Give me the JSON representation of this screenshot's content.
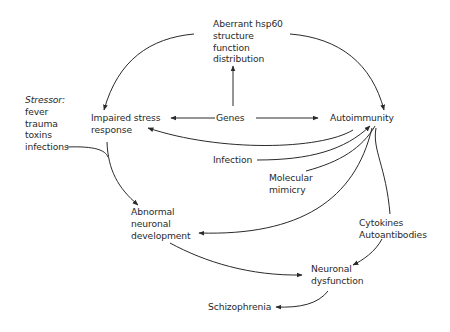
{
  "diagram": {
    "nodes": {
      "hsp60": {
        "lines": [
          "Aberrant hsp60",
          "structure",
          "function",
          "distribution"
        ]
      },
      "stressor": {
        "heading": "Stressor:",
        "lines": [
          "fever",
          "trauma",
          "toxins",
          "infections"
        ]
      },
      "impaired": {
        "lines": [
          "Impaired stress",
          "response"
        ]
      },
      "genes": {
        "lines": [
          "Genes"
        ]
      },
      "autoimmunity": {
        "lines": [
          "Autoimmunity"
        ]
      },
      "infection": {
        "lines": [
          "Infection"
        ]
      },
      "mimicry": {
        "lines": [
          "Molecular",
          "mimicry"
        ]
      },
      "abnormal": {
        "lines": [
          "Abnormal",
          "neuronal",
          "development"
        ]
      },
      "cytokines": {
        "lines": [
          "Cytokines",
          "Autoantibodies"
        ]
      },
      "dysfunction": {
        "lines": [
          "Neuronal",
          "dysfunction"
        ]
      },
      "schizophrenia": {
        "lines": [
          "Schizophrenia"
        ]
      }
    },
    "edges": [
      {
        "from": "hsp60",
        "to": "impaired"
      },
      {
        "from": "hsp60",
        "to": "autoimmunity"
      },
      {
        "from": "genes",
        "to": "hsp60"
      },
      {
        "from": "genes",
        "to": "impaired"
      },
      {
        "from": "genes",
        "to": "autoimmunity"
      },
      {
        "from": "autoimmunity",
        "to": "impaired"
      },
      {
        "from": "infection",
        "to": "autoimmunity"
      },
      {
        "from": "mimicry",
        "to": "autoimmunity"
      },
      {
        "from": "stressor",
        "to": "abnormal",
        "via": "impaired"
      },
      {
        "from": "autoimmunity",
        "to": "abnormal"
      },
      {
        "from": "autoimmunity",
        "to": "cytokines"
      },
      {
        "from": "abnormal",
        "to": "dysfunction"
      },
      {
        "from": "cytokines",
        "to": "dysfunction"
      },
      {
        "from": "dysfunction",
        "to": "schizophrenia"
      }
    ],
    "line_color": "#2a2a2a"
  }
}
